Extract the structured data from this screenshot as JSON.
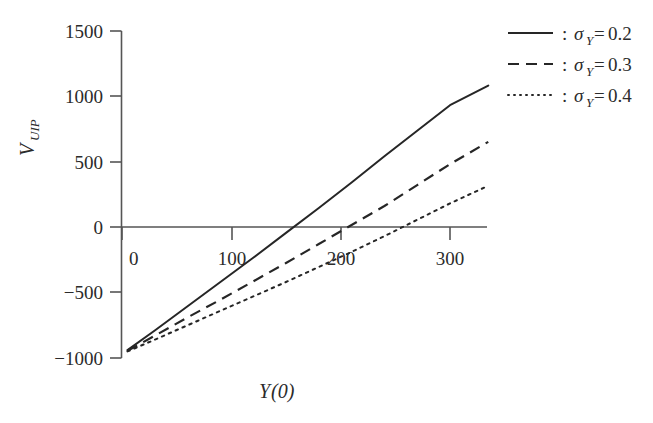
{
  "chart_data": {
    "type": "line",
    "title": "",
    "subtitle": "",
    "xlabel": "Y(0)",
    "xlabel_parts": {
      "symbol": "Y",
      "arg": "(0)"
    },
    "ylabel": "V_UIP",
    "ylabel_parts": {
      "symbol": "V",
      "subscript": "UIP"
    },
    "xlim": [
      -10,
      345
    ],
    "ylim": [
      -1100,
      1560
    ],
    "xticks": [
      0,
      100,
      200,
      300
    ],
    "xtick_labels": [
      "0",
      "100",
      "200",
      "300"
    ],
    "yticks": [
      1500,
      1000,
      500,
      0,
      -500,
      -1000
    ],
    "ytick_labels": [
      "1500",
      "1000",
      "500",
      "0",
      "−500",
      "−1000"
    ],
    "grid": false,
    "legend_position": "top-right",
    "zero_line": true,
    "axis_color": "#555555",
    "line_color": "#262626",
    "background": "#ffffff",
    "series": [
      {
        "name": "σ_Y=0.2",
        "sigma": "0.2",
        "style": "solid",
        "dasharray": "",
        "x": [
          5,
          30,
          60,
          90,
          120,
          150,
          180,
          210,
          240,
          270,
          300,
          335
        ],
        "values": [
          -940,
          -790,
          -605,
          -420,
          -235,
          -45,
          145,
          340,
          540,
          735,
          930,
          1080
        ],
        "zero_crossing": 152,
        "endpoint": [
          335,
          1080
        ]
      },
      {
        "name": "σ_Y=0.3",
        "sigma": "0.3",
        "style": "dashed",
        "dasharray": "11,7",
        "x": [
          5,
          30,
          60,
          90,
          120,
          150,
          180,
          210,
          240,
          270,
          300,
          335
        ],
        "values": [
          -945,
          -830,
          -690,
          -555,
          -415,
          -275,
          -130,
          15,
          160,
          320,
          480,
          650
        ],
        "zero_crossing": 197,
        "endpoint": [
          335,
          650
        ]
      },
      {
        "name": "σ_Y=0.4",
        "sigma": "0.4",
        "style": "dotted",
        "dasharray": "2.5,5",
        "x": [
          5,
          30,
          60,
          90,
          120,
          150,
          180,
          210,
          240,
          270,
          300,
          335
        ],
        "values": [
          -950,
          -860,
          -750,
          -640,
          -530,
          -420,
          -305,
          -190,
          -70,
          55,
          180,
          315
        ],
        "zero_crossing": 247,
        "endpoint": [
          335,
          315
        ]
      }
    ]
  },
  "legend": {
    "separator": ":",
    "entries": [
      {
        "sigma_symbol": "σ",
        "sigma_sub": "Y",
        "equals": "=",
        "value": "0.2",
        "style": "solid"
      },
      {
        "sigma_symbol": "σ",
        "sigma_sub": "Y",
        "equals": "=",
        "value": "0.3",
        "style": "dashed"
      },
      {
        "sigma_symbol": "σ",
        "sigma_sub": "Y",
        "equals": "=",
        "value": "0.4",
        "style": "dotted"
      }
    ]
  }
}
